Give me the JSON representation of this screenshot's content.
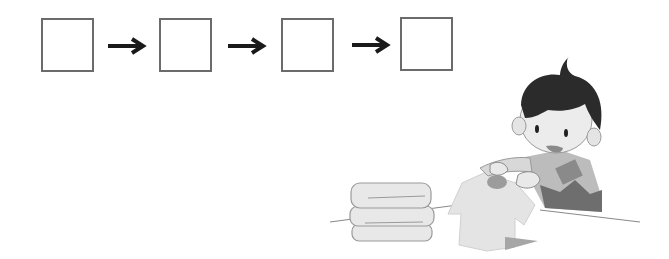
{
  "sequence": {
    "boxes": [
      {
        "index": 1,
        "value": ""
      },
      {
        "index": 2,
        "value": ""
      },
      {
        "index": 3,
        "value": ""
      },
      {
        "index": 4,
        "value": ""
      }
    ],
    "arrow_icon": "right-arrow-icon",
    "arrow_count": 3
  },
  "illustration": {
    "subject": "boy folding clothes",
    "items": [
      "folded-towel-stack",
      "t-shirt",
      "table"
    ]
  },
  "colors": {
    "box_border": "#6b6b6b",
    "arrow": "#1a1a1a",
    "hair": "#2b2b2b",
    "skin": "#ececec",
    "shirt_light": "#e6e6e6"
  }
}
